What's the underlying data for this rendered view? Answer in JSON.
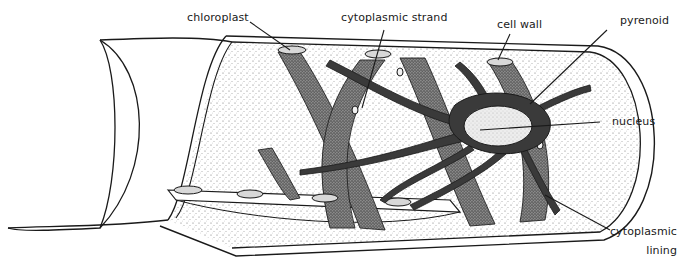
{
  "diagram": {
    "labels": {
      "chloroplast": "chloroplast",
      "cytoplasmic_strand": "cytoplasmic strand",
      "cell_wall": "cell wall",
      "pyrenoid": "pyrenoid",
      "nucleus": "nucleus",
      "cytoplasmic_lining_1": "cytoplasmic",
      "cytoplasmic_lining_2": "lining"
    },
    "colors": {
      "ink": "#1a1a1a",
      "stipple": "#444444",
      "background": "#ffffff"
    }
  }
}
